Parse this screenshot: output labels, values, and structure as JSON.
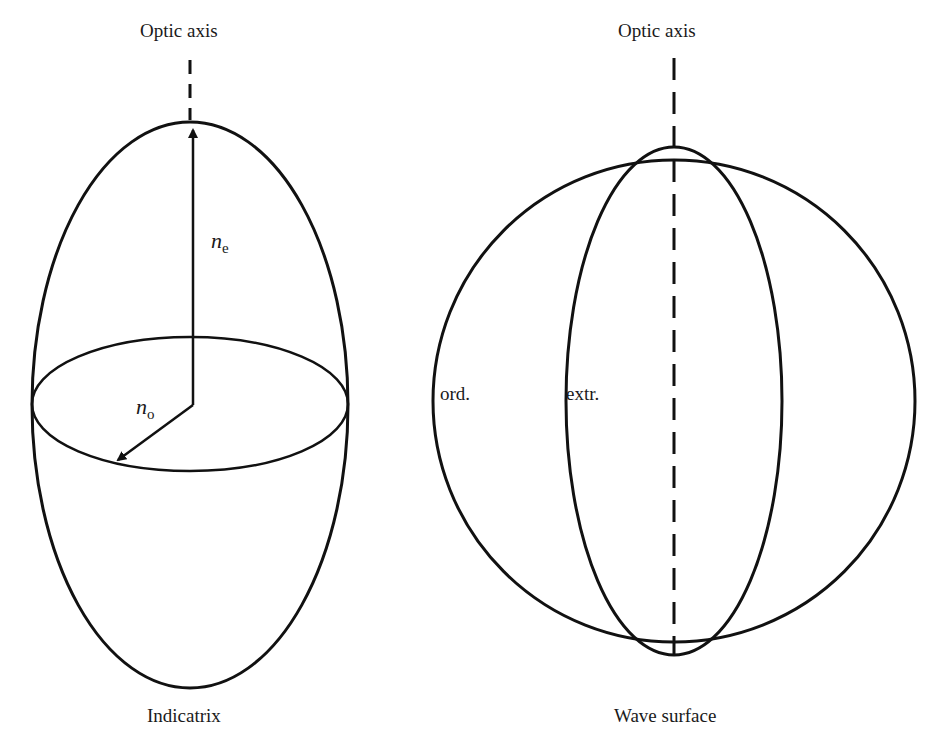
{
  "left_diagram": {
    "optic_axis_label": "Optic axis",
    "caption": "Indicatrix",
    "ne_label": {
      "symbol": "n",
      "subscript": "e"
    },
    "no_label": {
      "symbol": "n",
      "subscript": "o"
    }
  },
  "right_diagram": {
    "optic_axis_label": "Optic axis",
    "caption": "Wave surface",
    "ord_label": "ord.",
    "extr_label": "extr."
  },
  "colors": {
    "stroke": "#111111",
    "background": "#ffffff"
  }
}
